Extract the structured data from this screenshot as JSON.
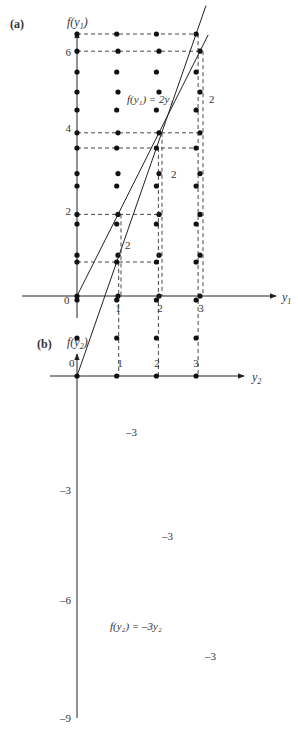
{
  "panels": [
    {
      "id": "a",
      "panel_label": "(a)",
      "y_axis_label": "f(y",
      "y_axis_sub": "1",
      "y_axis_close": ")",
      "x_axis_label": "y",
      "x_axis_sub": "1",
      "origin_label": "0",
      "x_ticks": [
        1,
        2,
        3
      ],
      "y_ticks": [
        2,
        4,
        6
      ],
      "x_tick_labels": [
        "1",
        "2",
        "3"
      ],
      "y_tick_labels": [
        "2",
        "4",
        "6"
      ],
      "grid_x": [
        0,
        1,
        2,
        3
      ],
      "grid_y": [
        0,
        1,
        2,
        3,
        4,
        5,
        6
      ],
      "function_label": "f(y₁) = 2y₁",
      "slope": 2,
      "step_labels": [
        "2",
        "2",
        "2"
      ],
      "dashed_horizontal": [
        {
          "y": 6,
          "to_x": 3
        },
        {
          "y": 4,
          "to_x": 3
        },
        {
          "y": 2,
          "to_x": 2
        }
      ],
      "dashed_vertical": [
        {
          "x": 1,
          "from_y": 2
        },
        {
          "x": 2,
          "from_y": 4
        },
        {
          "x": 3,
          "from_y": 6
        }
      ]
    },
    {
      "id": "b",
      "panel_label": "(b)",
      "y_axis_label": "f(y",
      "y_axis_sub": "2",
      "y_axis_close": ")",
      "x_axis_label": "y",
      "x_axis_sub": "2",
      "origin_label": "0",
      "x_ticks": [
        1,
        2,
        3
      ],
      "y_ticks": [
        -3,
        -6,
        -9
      ],
      "x_tick_labels": [
        "1",
        "2",
        "3"
      ],
      "y_tick_labels": [
        "–3",
        "–6",
        "–9"
      ],
      "grid_x": [
        0,
        1,
        2,
        3
      ],
      "grid_y": [
        0,
        -1,
        -2,
        -3,
        -4,
        -5,
        -6,
        -7,
        -8,
        -9
      ],
      "function_label": "f(y₂) = –3y₂",
      "slope": -3,
      "step_labels": [
        "–3",
        "–3",
        "–3"
      ],
      "dashed_horizontal": [
        {
          "y": -3,
          "to_x": 2
        },
        {
          "y": -6,
          "to_x": 3
        },
        {
          "y": -9,
          "to_x": 3
        }
      ],
      "dashed_vertical": [
        {
          "x": 1,
          "from_y": -3
        },
        {
          "x": 2,
          "from_y": -6
        },
        {
          "x": 3,
          "from_y": -9
        }
      ]
    }
  ]
}
